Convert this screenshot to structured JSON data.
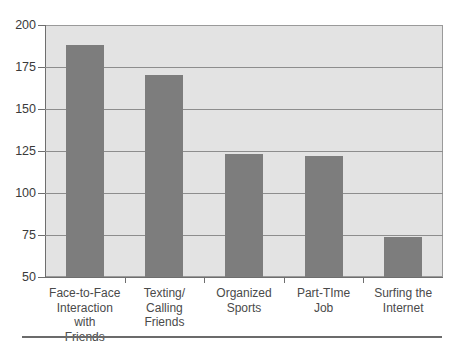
{
  "chart_data": {
    "type": "bar",
    "title": "",
    "subtitle": "",
    "xlabel": "",
    "ylabel": "",
    "ylim": [
      50,
      200
    ],
    "ytick_step": 25,
    "yticks": [
      200,
      175,
      150,
      125,
      100,
      75,
      50
    ],
    "grid": true,
    "legend": false,
    "orientation": "vertical",
    "categories": [
      "Face-to-Face\nInteraction with\nFriends",
      "Texting/\nCalling\nFriends",
      "Organized\nSports",
      "Part-TIme\nJob",
      "Surfing the\nInternet"
    ],
    "values": [
      188,
      170,
      123,
      122,
      74
    ],
    "bar_color": "#7d7d7d",
    "plot_background": "#e3e3e3",
    "gridline_color": "#8d8d8d",
    "axis_color": "#6e6e6e",
    "figure_background": "#ffffff"
  }
}
